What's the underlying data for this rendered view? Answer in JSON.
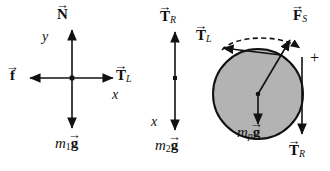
{
  "figure": {
    "type": "free-body-diagram-set",
    "background_color": "#ffffff",
    "stroke_color": "#111111",
    "pulley_fill_color": "#b3b3b3",
    "panel_count": 3
  },
  "block1": {
    "name": "block-1-free-body-diagram",
    "normal_force": "N",
    "friction_force": "f",
    "tension_left": "T",
    "tension_left_sub": "L",
    "weight_mass": "m",
    "weight_mass_sub": "1",
    "weight_g": "g",
    "axis_x": "x",
    "axis_y": "y"
  },
  "block2": {
    "name": "block-2-free-body-diagram",
    "tension_right": "T",
    "tension_right_sub": "R",
    "weight_mass": "m",
    "weight_mass_sub": "2",
    "weight_g": "g",
    "axis_x": "x"
  },
  "pulley": {
    "name": "pulley-free-body-diagram",
    "tension_left": "T",
    "tension_left_sub": "L",
    "tension_right": "T",
    "tension_right_sub": "R",
    "support_force": "F",
    "support_force_sub": "S",
    "weight_mass": "m",
    "weight_mass_sub": "p",
    "weight_g": "g",
    "positive_sense": "+",
    "arrow_accent": "→"
  },
  "glyphs": {
    "vector_arrow": "→"
  }
}
